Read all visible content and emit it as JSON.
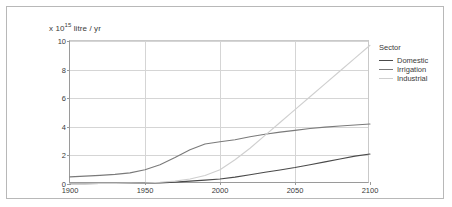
{
  "figure": {
    "yaxis_prefix": "x 10",
    "yaxis_exponent": "15",
    "yaxis_suffix": " litre / yr"
  },
  "legend": {
    "title": "Sector",
    "entries": [
      {
        "label": "Domestic",
        "color": "#4a4a4a"
      },
      {
        "label": "Irrigation",
        "color": "#7a7a7a"
      },
      {
        "label": "Industrial",
        "color": "#cfcfcf"
      }
    ]
  },
  "chart_data": {
    "type": "line",
    "title": "",
    "xlabel": "",
    "ylabel": "x 10^15 litre / yr",
    "xlim": [
      1900,
      2100
    ],
    "ylim": [
      0,
      10
    ],
    "xticks": [
      "1900",
      "1950",
      "2000",
      "2050",
      "2100"
    ],
    "yticks": [
      "0",
      "2",
      "4",
      "6",
      "8",
      "10"
    ],
    "grid": true,
    "legend_position": "right",
    "x": [
      1900,
      1910,
      1920,
      1930,
      1940,
      1950,
      1960,
      1970,
      1980,
      1990,
      2000,
      2010,
      2020,
      2030,
      2040,
      2050,
      2060,
      2070,
      2080,
      2090,
      2100
    ],
    "series": [
      {
        "name": "Domestic",
        "color": "#4a4a4a",
        "values": [
          0.02,
          0.02,
          0.03,
          0.03,
          0.04,
          0.05,
          0.08,
          0.13,
          0.2,
          0.27,
          0.35,
          0.48,
          0.65,
          0.82,
          0.98,
          1.15,
          1.35,
          1.55,
          1.75,
          1.95,
          2.1
        ]
      },
      {
        "name": "Irrigation",
        "color": "#7a7a7a",
        "values": [
          0.5,
          0.55,
          0.6,
          0.67,
          0.78,
          1.0,
          1.35,
          1.85,
          2.4,
          2.8,
          2.95,
          3.1,
          3.3,
          3.48,
          3.63,
          3.75,
          3.88,
          3.98,
          4.06,
          4.13,
          4.2
        ]
      },
      {
        "name": "Industrial",
        "color": "#cfcfcf",
        "values": [
          0.02,
          0.02,
          0.03,
          0.04,
          0.05,
          0.07,
          0.12,
          0.2,
          0.35,
          0.6,
          1.0,
          1.7,
          2.5,
          3.4,
          4.3,
          5.2,
          6.1,
          7.0,
          7.9,
          8.8,
          9.7
        ]
      }
    ]
  }
}
